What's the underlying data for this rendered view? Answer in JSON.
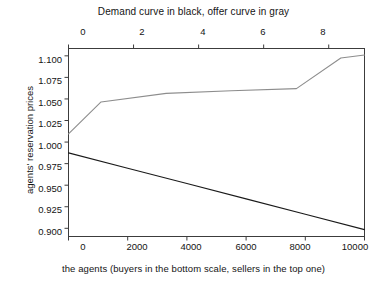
{
  "figure": {
    "title_top": "Demand curve in black, offer curve in gray",
    "title_bottom": "the agents (buyers in the bottom scale, sellers in the top one)",
    "ylabel": "agents' reservation prices"
  },
  "colors": {
    "demand": "#1a1a1a",
    "offer": "#8d8d8d",
    "axis": "#3c3c3c",
    "text": "#141414",
    "background": "#ffffff"
  },
  "axes": {
    "y_ticks": [
      "1.100",
      "1.075",
      "1.050",
      "1.025",
      "1.000",
      "0.975",
      "0.950",
      "0.925",
      "0.900"
    ],
    "x_bottom_ticks": [
      "0",
      "2000",
      "4000",
      "6000",
      "8000",
      "10000"
    ],
    "x_top_ticks": [
      "0",
      "2",
      "4",
      "6",
      "8"
    ]
  },
  "chart_data": {
    "type": "line",
    "title": "Demand curve in black, offer curve in gray",
    "xlabel": "the agents (buyers in the bottom scale, sellers in the top one)",
    "ylabel": "agents' reservation prices",
    "grid": false,
    "legend": "none (curves labelled in title)",
    "xlim": [
      0,
      10000
    ],
    "ylim": [
      0.8905,
      1.1085
    ],
    "x_top_lim": [
      0,
      9.1
    ],
    "y_ticks": [
      1.1,
      1.075,
      1.05,
      1.025,
      1.0,
      0.975,
      0.95,
      0.925,
      0.9
    ],
    "x_bottom_ticks": [
      0,
      2000,
      4000,
      6000,
      8000,
      10000
    ],
    "x_top_ticks": [
      0,
      2,
      4,
      6,
      8
    ],
    "series": [
      {
        "name": "Demand curve (buyers, bottom scale)",
        "color": "#1a1a1a",
        "style": "solid",
        "x": [
          0,
          2000,
          4000,
          6000,
          8000,
          10000
        ],
        "y": [
          0.9875,
          0.9697,
          0.9519,
          0.9341,
          0.9163,
          0.8985
        ]
      },
      {
        "name": "Offer curve (sellers, top scale)",
        "color": "#8d8d8d",
        "style": "solid",
        "x": [
          0,
          1100,
          3300,
          5500,
          7700,
          9200,
          10000
        ],
        "y": [
          1.0095,
          1.0465,
          1.0565,
          1.0595,
          1.062,
          1.0975,
          1.101
        ]
      }
    ]
  }
}
